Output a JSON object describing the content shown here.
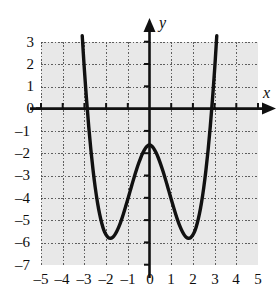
{
  "figure": {
    "kind": "coordinate-graph",
    "background_color": "#ffffff",
    "plot_background_color": "#e8e8e8",
    "grid_color": "#464646",
    "axis_color": "#111111",
    "curve_color": "#111111"
  },
  "axis_labels": {
    "x": "x",
    "y": "y"
  },
  "chart_data": {
    "type": "line",
    "title": "",
    "xlabel": "x",
    "ylabel": "y",
    "xlim": [
      -5,
      5
    ],
    "ylim": [
      -7,
      3
    ],
    "grid": true,
    "legend": "none",
    "xticks": [
      -5,
      -4,
      -3,
      -2,
      -1,
      0,
      1,
      2,
      3,
      4,
      5
    ],
    "xtick_labels": [
      "–5",
      "–4",
      "–3",
      "–2",
      "–1",
      "0",
      "1",
      "2",
      "3",
      "4",
      "5"
    ],
    "yticks": [
      3,
      2,
      1,
      0,
      -1,
      -2,
      -3,
      -4,
      -5,
      -6,
      -7
    ],
    "ytick_labels": [
      "3",
      "2",
      "1",
      "0",
      "–1",
      "–2",
      "–3",
      "–4",
      "–5",
      "–6",
      "–7"
    ],
    "series": [
      {
        "name": "quartic",
        "description": "W-shaped quartic with two minima near (-2, -5.6) and (2, -5.6) and a local maximum at (0, -1.6)",
        "x": [
          -3.1,
          -3.05,
          -3.0,
          -2.9,
          -2.8,
          -2.7,
          -2.6,
          -2.5,
          -2.4,
          -2.3,
          -2.2,
          -2.1,
          -2.0,
          -1.9,
          -1.8,
          -1.7,
          -1.6,
          -1.5,
          -1.4,
          -1.3,
          -1.2,
          -1.1,
          -1.0,
          -0.9,
          -0.8,
          -0.7,
          -0.6,
          -0.5,
          -0.4,
          -0.3,
          -0.2,
          -0.1,
          0.0,
          0.1,
          0.2,
          0.3,
          0.4,
          0.5,
          0.6,
          0.7,
          0.8,
          0.9,
          1.0,
          1.1,
          1.2,
          1.3,
          1.4,
          1.5,
          1.6,
          1.7,
          1.8,
          1.9,
          2.0,
          2.1,
          2.2,
          2.3,
          2.4,
          2.5,
          2.6,
          2.7,
          2.8,
          2.9,
          3.0,
          3.05,
          3.1
        ],
        "y": [
          3.28,
          2.5,
          1.75,
          0.4,
          -0.8,
          -1.85,
          -2.75,
          -3.53,
          -4.18,
          -4.71,
          -5.13,
          -5.45,
          -5.65,
          -5.77,
          -5.8,
          -5.76,
          -5.65,
          -5.48,
          -5.26,
          -5.0,
          -4.7,
          -4.38,
          -4.05,
          -3.71,
          -3.37,
          -3.04,
          -2.73,
          -2.44,
          -2.18,
          -1.96,
          -1.78,
          -1.66,
          -1.6,
          -1.66,
          -1.78,
          -1.96,
          -2.18,
          -2.44,
          -2.73,
          -3.04,
          -3.37,
          -3.71,
          -4.05,
          -4.38,
          -4.7,
          -5.0,
          -5.26,
          -5.48,
          -5.65,
          -5.76,
          -5.8,
          -5.77,
          -5.65,
          -5.45,
          -5.13,
          -4.71,
          -4.18,
          -3.53,
          -2.75,
          -1.85,
          -0.8,
          0.4,
          1.75,
          2.5,
          3.28
        ]
      }
    ],
    "key_points": {
      "local_minima": [
        {
          "x": -2,
          "y": -5.6
        },
        {
          "x": 2,
          "y": -5.6
        }
      ],
      "local_maximum": {
        "x": 0,
        "y": -1.6
      },
      "x_intercepts": [
        -2.85,
        2.85
      ]
    }
  }
}
